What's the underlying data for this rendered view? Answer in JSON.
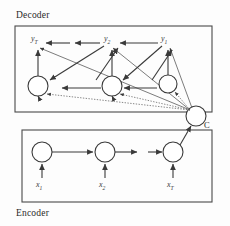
{
  "figure": {
    "kind": "encoder-decoder-attention-diagram",
    "decoder_label": "Decoder",
    "encoder_label": "Encoder",
    "context_label": "C",
    "colors": {
      "stroke": "#3a3a3a",
      "box_stroke": "#4a4a4a",
      "node_fill": "#ffffff",
      "background": "#fdfdfd",
      "text": "#2a2a2a"
    },
    "decoder_box": {
      "x": 15,
      "y": 26,
      "w": 197,
      "h": 86
    },
    "encoder_box": {
      "x": 22,
      "y": 130,
      "w": 190,
      "h": 72
    },
    "context_node": {
      "cx": 196,
      "cy": 116,
      "r": 10
    },
    "decoder_hidden_nodes": [
      {
        "cx": 38,
        "cy": 86,
        "r": 10,
        "name": "decoder-state-T"
      },
      {
        "cx": 112,
        "cy": 86,
        "r": 10,
        "name": "decoder-state-2"
      },
      {
        "cx": 168,
        "cy": 84,
        "r": 9,
        "name": "decoder-state-1"
      }
    ],
    "encoder_hidden_nodes": [
      {
        "cx": 42,
        "cy": 152,
        "r": 10,
        "name": "encoder-state-1"
      },
      {
        "cx": 105,
        "cy": 152,
        "r": 10,
        "name": "encoder-state-2"
      },
      {
        "cx": 173,
        "cy": 152,
        "r": 10,
        "name": "encoder-state-T"
      }
    ],
    "output_labels": [
      {
        "base": "y",
        "sub": "T",
        "x": 31,
        "y": 36
      },
      {
        "base": "y",
        "sub": "2",
        "x": 104,
        "y": 36
      },
      {
        "base": "y",
        "sub": "1",
        "x": 161,
        "y": 36
      }
    ],
    "input_labels": [
      {
        "base": "x",
        "sub": "1",
        "x": 36,
        "y": 182
      },
      {
        "base": "x",
        "sub": "2",
        "x": 99,
        "y": 182
      },
      {
        "base": "x",
        "sub": "T",
        "x": 167,
        "y": 182
      }
    ]
  }
}
